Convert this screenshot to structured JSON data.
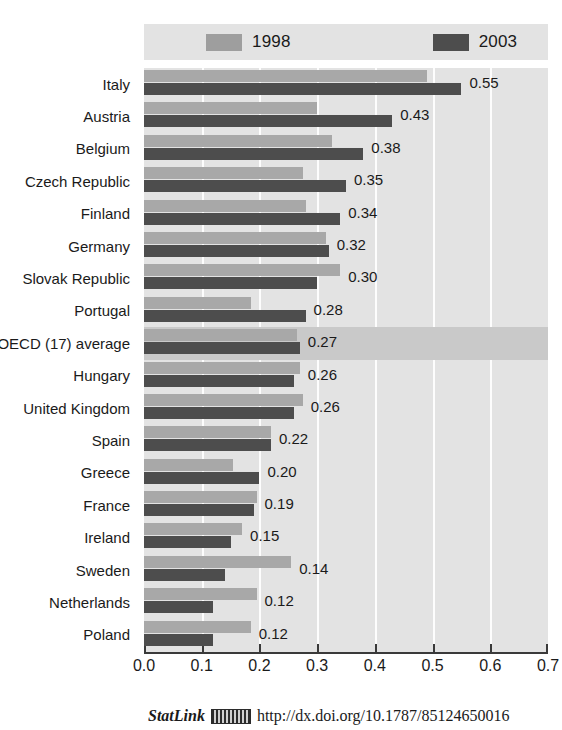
{
  "legend": {
    "items": [
      {
        "label": "1998",
        "color": "#9e9e9e",
        "swatch_name": "legend-swatch-1998"
      },
      {
        "label": "2003",
        "color": "#4d4d4d",
        "swatch_name": "legend-swatch-2003"
      }
    ]
  },
  "footer": {
    "statlink_word": "StatLink",
    "statlink_icon": "statlink-barcode-icon",
    "url": "http://dx.doi.org/10.1787/85124650016"
  },
  "axis": {
    "ticks": [
      "0.0",
      "0.1",
      "0.2",
      "0.3",
      "0.4",
      "0.5",
      "0.6",
      "0.7"
    ],
    "min": 0.0,
    "max": 0.7
  },
  "colors": {
    "series_1998": "#a8a8a8",
    "series_2003": "#4d4d4d",
    "plot_background": "#e3e3e3",
    "highlight_band": "#c9c9c9",
    "gridline": "#fdfdfd",
    "axis": "#3a3a3a",
    "text": "#1a1a1a"
  },
  "chart_data": {
    "type": "bar",
    "orientation": "horizontal",
    "title": "",
    "subtitle": "",
    "xlabel": "",
    "ylabel": "",
    "xlim": [
      0.0,
      0.7
    ],
    "xticks": [
      0.0,
      0.1,
      0.2,
      0.3,
      0.4,
      0.5,
      0.6,
      0.7
    ],
    "grid": true,
    "legend_position": "top",
    "highlight_category": "OECD (17) average",
    "categories": [
      "Italy",
      "Austria",
      "Belgium",
      "Czech Republic",
      "Finland",
      "Germany",
      "Slovak Republic",
      "Portugal",
      "OECD (17) average",
      "Hungary",
      "United Kingdom",
      "Spain",
      "Greece",
      "France",
      "Ireland",
      "Sweden",
      "Netherlands",
      "Poland"
    ],
    "series": [
      {
        "name": "1998",
        "color": "#a8a8a8",
        "values": [
          0.49,
          0.3,
          0.325,
          0.275,
          0.28,
          0.315,
          0.34,
          0.185,
          0.265,
          0.27,
          0.275,
          0.22,
          0.155,
          0.195,
          0.17,
          0.255,
          0.195,
          0.185
        ],
        "labels_shown": false
      },
      {
        "name": "2003",
        "color": "#4d4d4d",
        "values": [
          0.55,
          0.43,
          0.38,
          0.35,
          0.34,
          0.32,
          0.3,
          0.28,
          0.27,
          0.26,
          0.26,
          0.22,
          0.2,
          0.19,
          0.15,
          0.14,
          0.12,
          0.12
        ],
        "labels_shown": true,
        "data_labels": [
          "0.55",
          "0.43",
          "0.38",
          "0.35",
          "0.34",
          "0.32",
          "0.30",
          "0.28",
          "0.27",
          "0.26",
          "0.26",
          "0.22",
          "0.20",
          "0.19",
          "0.15",
          "0.14",
          "0.12",
          "0.12"
        ]
      }
    ]
  }
}
